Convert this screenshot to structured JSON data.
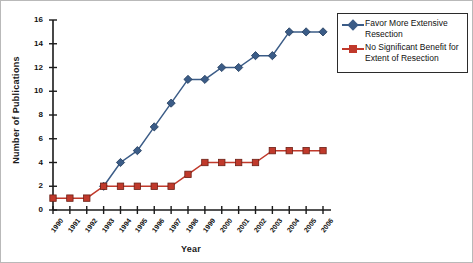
{
  "chart_data": {
    "type": "line",
    "title": "",
    "xlabel": "Year",
    "ylabel": "Number of Publications",
    "categories": [
      "1990",
      "1991",
      "1992",
      "1993",
      "1994",
      "1995",
      "1996",
      "1997",
      "1998",
      "1999",
      "2000",
      "2001",
      "2002",
      "2003",
      "2004",
      "2005",
      "2006"
    ],
    "xlim": [
      1990,
      2006
    ],
    "ylim": [
      0,
      16
    ],
    "yticks": [
      0,
      2,
      4,
      6,
      8,
      10,
      12,
      14,
      16
    ],
    "grid": false,
    "legend_position": "top-right",
    "series": [
      {
        "name": "Favor More Extensive Resection",
        "color": "#3b5c87",
        "marker": "diamond",
        "x": [
          "1993",
          "1994",
          "1995",
          "1996",
          "1997",
          "1998",
          "1999",
          "2000",
          "2001",
          "2002",
          "2003",
          "2004",
          "2005",
          "2006"
        ],
        "values": [
          2,
          4,
          5,
          7,
          9,
          11,
          11,
          12,
          12,
          13,
          13,
          15,
          15,
          15
        ]
      },
      {
        "name": "No Significant Benefit for Extent of Resection",
        "color": "#c0392b",
        "marker": "square",
        "x": [
          "1990",
          "1991",
          "1992",
          "1993",
          "1994",
          "1995",
          "1996",
          "1997",
          "1998",
          "1999",
          "2000",
          "2001",
          "2002",
          "2003",
          "2004",
          "2005",
          "2006"
        ],
        "values": [
          1,
          1,
          1,
          2,
          2,
          2,
          2,
          2,
          3,
          4,
          4,
          4,
          4,
          5,
          5,
          5,
          5
        ]
      }
    ]
  },
  "legend": {
    "items": [
      {
        "label_line1": "Favor More Extensive",
        "label_line2": "Resection"
      },
      {
        "label_line1": "No Significant Benefit for",
        "label_line2": "Extent of Resection"
      }
    ]
  }
}
